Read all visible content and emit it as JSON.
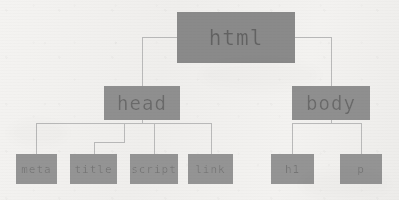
{
  "diagram": {
    "type": "tree",
    "colors": {
      "background": "#f2f1ef",
      "node_fill": "#8d8d8d",
      "node_text": "#5c5c5c",
      "edge": "#b9b9b9"
    },
    "nodes": [
      {
        "id": "html",
        "label": "html",
        "level": 0,
        "x": 177,
        "y": 12,
        "w": 118,
        "h": 51
      },
      {
        "id": "head",
        "label": "head",
        "level": 1,
        "x": 104,
        "y": 86,
        "w": 76,
        "h": 34
      },
      {
        "id": "body",
        "label": "body",
        "level": 1,
        "x": 292,
        "y": 86,
        "w": 78,
        "h": 34
      },
      {
        "id": "meta",
        "label": "meta",
        "level": 2,
        "x": 16,
        "y": 154,
        "w": 41,
        "h": 30
      },
      {
        "id": "title",
        "label": "title",
        "level": 2,
        "x": 70,
        "y": 154,
        "w": 47,
        "h": 30
      },
      {
        "id": "script",
        "label": "script",
        "level": 2,
        "x": 130,
        "y": 154,
        "w": 48,
        "h": 30
      },
      {
        "id": "link",
        "label": "link",
        "level": 2,
        "x": 188,
        "y": 154,
        "w": 45,
        "h": 30
      },
      {
        "id": "h1",
        "label": "h1",
        "level": 2,
        "x": 271,
        "y": 154,
        "w": 43,
        "h": 30
      },
      {
        "id": "p",
        "label": "p",
        "level": 2,
        "x": 340,
        "y": 154,
        "w": 42,
        "h": 30
      }
    ],
    "edges": [
      {
        "from": "html",
        "to": "head",
        "name": "edge-html-head"
      },
      {
        "from": "html",
        "to": "body",
        "name": "edge-html-body"
      },
      {
        "from": "head",
        "to": "meta",
        "name": "edge-head-meta"
      },
      {
        "from": "head",
        "to": "title",
        "name": "edge-head-title"
      },
      {
        "from": "head",
        "to": "script",
        "name": "edge-head-script"
      },
      {
        "from": "head",
        "to": "link",
        "name": "edge-head-link"
      },
      {
        "from": "body",
        "to": "h1",
        "name": "edge-body-h1"
      },
      {
        "from": "body",
        "to": "p",
        "name": "edge-body-p"
      }
    ]
  }
}
